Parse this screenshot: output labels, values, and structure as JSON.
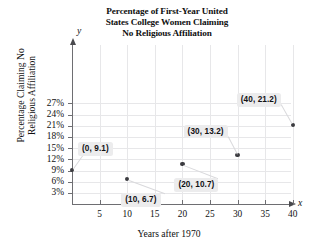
{
  "chart_data": {
    "type": "scatter",
    "title": "Percentage of First-Year United States College Women Claiming No Religious Affiliation",
    "title_lines": [
      "Percentage of First-Year United",
      "States College Women Claiming",
      "No Religious Affiliation"
    ],
    "xlabel": "Years after 1970",
    "ylabel": "Percentage Claiming No Religious Affiliation",
    "ylabel_lines": [
      "Percentage Claiming No",
      "Religious Affiliation"
    ],
    "x_axis_variable": "x",
    "y_axis_variable": "y",
    "grid": true,
    "legend": "none",
    "xlim": [
      0,
      43
    ],
    "ylim": [
      0,
      28.5
    ],
    "xticks": [
      5,
      10,
      15,
      20,
      25,
      30,
      35,
      40
    ],
    "xtick_labels": [
      "5",
      "10",
      "15",
      "20",
      "25",
      "30",
      "35",
      "40"
    ],
    "yticks": [
      3,
      6,
      9,
      12,
      15,
      18,
      21,
      24,
      27
    ],
    "ytick_labels": [
      "3%",
      "6%",
      "9%",
      "12%",
      "15%",
      "18%",
      "21%",
      "24%",
      "27%"
    ],
    "x": [
      0,
      10,
      20,
      30,
      40
    ],
    "y": [
      9.1,
      6.7,
      10.7,
      13.2,
      21.2
    ],
    "points": [
      {
        "x": 0,
        "y": 9.1,
        "label": "(0, 9.1)",
        "label_position": "above-right"
      },
      {
        "x": 10,
        "y": 6.7,
        "label": "(10, 6.7)",
        "label_position": "below-right"
      },
      {
        "x": 20,
        "y": 10.7,
        "label": "(20, 10.7)",
        "label_position": "below-right"
      },
      {
        "x": 30,
        "y": 13.2,
        "label": "(30, 13.2)",
        "label_position": "above-left"
      },
      {
        "x": 40,
        "y": 21.2,
        "label": "(40, 21.2)",
        "label_position": "above-left"
      }
    ],
    "colors": {
      "marker": "#3b3b40",
      "axis": "#6e6e72",
      "grid": "#e7e7e9",
      "label_background": "#ececed",
      "text": "#101010"
    }
  }
}
